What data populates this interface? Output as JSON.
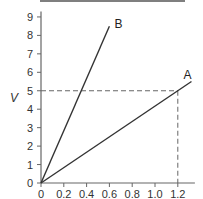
{
  "chart_data": {
    "type": "line",
    "title": "",
    "xlabel": "I",
    "ylabel": "V",
    "xlim": [
      0,
      1.35
    ],
    "ylim": [
      0,
      9.3
    ],
    "x_ticks": [
      "0",
      "0.2",
      "0.4",
      "0.6",
      "0.8",
      "1.0",
      "1.2"
    ],
    "y_ticks": [
      "0",
      "1",
      "2",
      "3",
      "4",
      "5",
      "6",
      "7",
      "8",
      "9"
    ],
    "grid": false,
    "legend": "none",
    "series": [
      {
        "name": "A",
        "x": [
          0,
          1.32
        ],
        "y": [
          0,
          5.5
        ]
      },
      {
        "name": "B",
        "x": [
          0,
          0.6
        ],
        "y": [
          0,
          8.5
        ]
      }
    ],
    "annotations": [
      {
        "type": "dashed-horizontal",
        "y": 5,
        "x_from": 0,
        "x_to": 1.2
      },
      {
        "type": "dashed-vertical",
        "x": 1.2,
        "y_from": 0,
        "y_to": 5
      }
    ]
  },
  "labels": {
    "series_a": "A",
    "series_b": "B",
    "x_axis": "I",
    "y_axis": "V"
  }
}
